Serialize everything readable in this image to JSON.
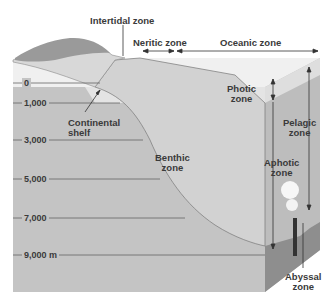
{
  "diagram": {
    "top_labels": {
      "intertidal": "Intertidal zone",
      "neritic": "Neritic zone",
      "oceanic": "Oceanic zone"
    },
    "zone_labels": {
      "continental_shelf_line1": "Continental",
      "continental_shelf_line2": "shelf",
      "benthic_line1": "Benthic",
      "benthic_line2": "zone",
      "photic_line1": "Photic",
      "photic_line2": "zone",
      "pelagic_line1": "Pelagic",
      "pelagic_line2": "zone",
      "aphotic_line1": "Aphotic",
      "aphotic_line2": "zone",
      "abyssal_line1": "Abyssal",
      "abyssal_line2": "zone"
    },
    "depth_scale": [
      {
        "label": "0"
      },
      {
        "label": "1,000"
      },
      {
        "label": "3,000"
      },
      {
        "label": "5,000"
      },
      {
        "label": "7,000"
      },
      {
        "label": "9,000 m"
      }
    ],
    "colors": {
      "water": "#c4c4c4",
      "photic": "#e6e6e6",
      "surface": "#f2f2f2",
      "slope": "#d6d6d6",
      "side_dark": "#8e8e8e",
      "line": "#555555"
    }
  }
}
